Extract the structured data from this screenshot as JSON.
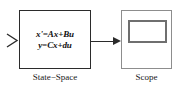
{
  "diagram": {
    "background_color": "#ffffff",
    "line_color": "#2b2b2b",
    "blocks": [
      {
        "id": "state-space",
        "caption": "State−Space",
        "equations": [
          "x'=Ax+Bu",
          "y=Cx+du"
        ],
        "border_color": "#2b2b2b"
      },
      {
        "id": "scope",
        "caption": "Scope",
        "border_color": "#8d8d8d",
        "screen_border_color": "#6f6f6f"
      }
    ],
    "ports": {
      "input_label": "input-port-chevron"
    },
    "connections": [
      {
        "from": "state-space",
        "to": "scope",
        "label": ""
      }
    ]
  }
}
